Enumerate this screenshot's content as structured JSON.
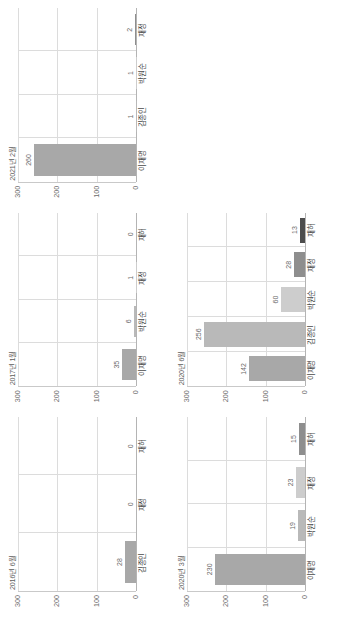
{
  "page": {
    "orientation": "landscape-rotated",
    "background": "#ffffff"
  },
  "axis": {
    "yticks": [
      "300",
      "200",
      "100",
      "0"
    ],
    "ymax": 300,
    "ymin": 0
  },
  "colors": {
    "bar_default": "#a6a6a6",
    "grid": "#dcdcdc",
    "axis": "#b4b4b4",
    "label_text": "#6a6a6a",
    "title_text": "#5d5d5d"
  },
  "chart_data": [
    {
      "id": "chart-2016-06",
      "type": "bar",
      "title": "2016년 6월",
      "categories": [
        "김종인",
        "재정",
        "재허"
      ],
      "values": [
        28,
        0,
        0
      ],
      "value_labels": [
        "28",
        "0",
        "0"
      ],
      "ylim": [
        0,
        300
      ],
      "yticks": [
        "300",
        "200",
        "100",
        "0"
      ],
      "xlabel": "",
      "ylabel": "",
      "grid": true,
      "legend": "none"
    },
    {
      "id": "chart-2017-01",
      "type": "bar",
      "title": "2017년 1월",
      "categories": [
        "이재명",
        "박원순",
        "재정",
        "재허"
      ],
      "values": [
        35,
        6,
        1,
        0
      ],
      "value_labels": [
        "35",
        "6",
        "1",
        "0"
      ],
      "ylim": [
        0,
        300
      ],
      "yticks": [
        "300",
        "200",
        "100",
        "0"
      ],
      "xlabel": "",
      "ylabel": "",
      "grid": true,
      "legend": "none"
    },
    {
      "id": "chart-2021-02",
      "type": "bar",
      "title": "2021년 2월",
      "categories": [
        "이재명",
        "김종인",
        "박원순",
        "재정"
      ],
      "values": [
        260,
        1,
        1,
        2
      ],
      "value_labels": [
        "260",
        "1",
        "1",
        "2"
      ],
      "ylim": [
        0,
        300
      ],
      "yticks": [
        "300",
        "200",
        "100",
        "0"
      ],
      "xlabel": "",
      "ylabel": "",
      "grid": true,
      "legend": "none"
    },
    {
      "id": "chart-2020-03",
      "type": "bar",
      "title": "2020년 3월",
      "categories": [
        "이재명",
        "박원순",
        "재정",
        "재허"
      ],
      "values": [
        230,
        19,
        23,
        15
      ],
      "value_labels": [
        "230",
        "19",
        "23",
        "15"
      ],
      "ylim": [
        0,
        300
      ],
      "yticks": [
        "300",
        "200",
        "100",
        "0"
      ],
      "xlabel": "",
      "ylabel": "",
      "grid": true,
      "legend": "none"
    },
    {
      "id": "chart-2020-06",
      "type": "bar",
      "title": "2020년 6월",
      "categories": [
        "이재명",
        "김종인",
        "박원순",
        "재정",
        "재허"
      ],
      "values": [
        142,
        256,
        60,
        28,
        13
      ],
      "value_labels": [
        "142",
        "256",
        "60",
        "28",
        "13"
      ],
      "ylim": [
        0,
        300
      ],
      "yticks": [
        "300",
        "200",
        "100",
        "0"
      ],
      "xlabel": "",
      "ylabel": "",
      "grid": true,
      "legend": "none"
    }
  ]
}
